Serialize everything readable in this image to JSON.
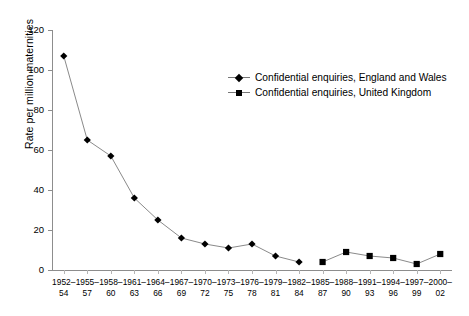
{
  "chart_data": {
    "type": "line",
    "title": "",
    "xlabel": "",
    "ylabel": "Rate per million maternities",
    "ylim": [
      0,
      120
    ],
    "yticks": [
      0,
      20,
      40,
      60,
      80,
      100,
      120
    ],
    "grid": false,
    "legend_position": "top-right-inside",
    "categories": [
      "1952–54",
      "1955–57",
      "1958–60",
      "1961–63",
      "1964–66",
      "1967–69",
      "1970–72",
      "1973–75",
      "1976–78",
      "1979–81",
      "1982–84",
      "1985–87",
      "1988–90",
      "1991–93",
      "1994–96",
      "1997–99",
      "2000–02"
    ],
    "categories_line1": [
      "1952–",
      "1955–",
      "1958–",
      "1961–",
      "1964–",
      "1967–",
      "1970–",
      "1973–",
      "1976–",
      "1979–",
      "1982–",
      "1985–",
      "1988–",
      "1991–",
      "1994–",
      "1997–",
      "2000–"
    ],
    "categories_line2": [
      "54",
      "57",
      "60",
      "63",
      "66",
      "69",
      "72",
      "75",
      "78",
      "81",
      "84",
      "87",
      "90",
      "93",
      "96",
      "99",
      "02"
    ],
    "series": [
      {
        "name": "Confidential enquiries, England and Wales",
        "marker": "diamond",
        "color": "#000000",
        "line_color": "#8a8a8a",
        "values": [
          107,
          65,
          57,
          36,
          25,
          16,
          13,
          11,
          13,
          7,
          4,
          null,
          null,
          null,
          null,
          null,
          null
        ]
      },
      {
        "name": "Confidential enquiries, United Kingdom",
        "marker": "square",
        "color": "#000000",
        "line_color": "#8a8a8a",
        "values": [
          null,
          null,
          null,
          null,
          null,
          null,
          null,
          null,
          null,
          null,
          null,
          4,
          9,
          7,
          6,
          3,
          8
        ]
      }
    ]
  },
  "legend": {
    "items": [
      {
        "label": "Confidential enquiries, England and Wales",
        "marker": "diamond"
      },
      {
        "label": "Confidential enquiries, United Kingdom",
        "marker": "square"
      }
    ]
  }
}
